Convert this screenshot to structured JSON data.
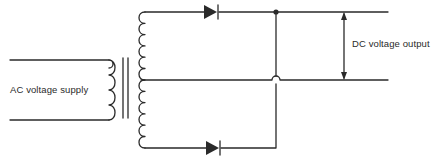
{
  "diagram": {
    "type": "full-wave rectifier (center-tapped transformer)",
    "labels": {
      "input": "AC voltage supply",
      "output": "DC voltage output"
    },
    "components": [
      {
        "name": "transformer-primary",
        "kind": "coil",
        "turns": 4
      },
      {
        "name": "transformer-core",
        "kind": "iron-core",
        "lines": 2
      },
      {
        "name": "transformer-secondary",
        "kind": "center-tapped coil",
        "turns": 12
      },
      {
        "name": "diode-top",
        "kind": "diode"
      },
      {
        "name": "diode-bottom",
        "kind": "diode"
      },
      {
        "name": "output-junction",
        "kind": "junction-dot"
      },
      {
        "name": "wire-crossover",
        "kind": "wire-hop"
      },
      {
        "name": "output-arrow",
        "kind": "double-headed arrow"
      }
    ],
    "colors": {
      "line": "#2a2a2a",
      "background": "#ffffff"
    }
  }
}
